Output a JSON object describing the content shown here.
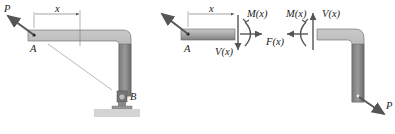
{
  "figure": {
    "panel_left": {
      "labels": {
        "force": "P",
        "point_a": "A",
        "point_b": "B",
        "distance": "x"
      }
    },
    "panel_cut_left": {
      "labels": {
        "point_a": "A",
        "distance": "x",
        "moment": "M(x)",
        "shear": "V(x)"
      }
    },
    "panel_center": {
      "labels": {
        "axial": "F(x)"
      }
    },
    "panel_cut_right": {
      "labels": {
        "moment": "M(x)",
        "shear": "V(x)",
        "force": "P"
      }
    },
    "colors": {
      "member_fill": "#a8a8a8",
      "member_dark": "#6e6e6e",
      "member_light": "#c9c9c9",
      "arrow": "#555555",
      "ground": "#d4d4d4",
      "text": "#222222"
    }
  }
}
